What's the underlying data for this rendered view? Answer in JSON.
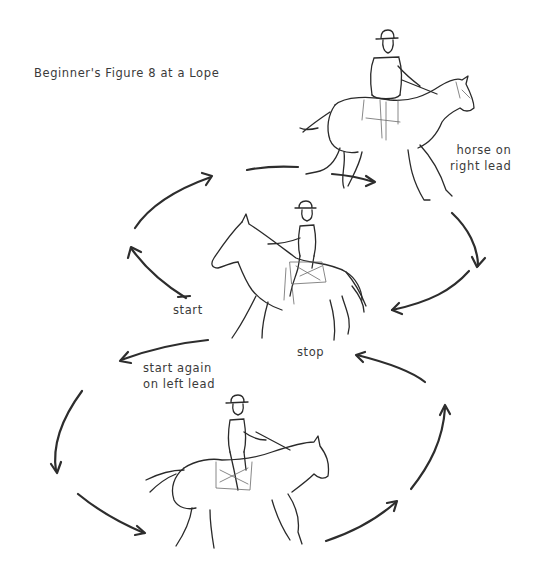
{
  "diagram": {
    "title": "Beginner's Figure 8 at a Lope",
    "labels": {
      "right_lead": [
        "horse on",
        "right lead"
      ],
      "start": "start",
      "stop": "stop",
      "start_again": [
        "start again",
        "on left lead"
      ]
    },
    "figures": [
      {
        "name": "horse-right-lead",
        "description": "horse and rider loping to the right, top"
      },
      {
        "name": "horse-center-stop",
        "description": "horse and rider at center, facing left"
      },
      {
        "name": "horse-left-lead",
        "description": "horse and rider loping to the right, bottom"
      }
    ],
    "arrows": [
      {
        "name": "arrow-start-up-left",
        "direction": "up"
      },
      {
        "name": "arrow-top-left-arc",
        "direction": "right"
      },
      {
        "name": "arrow-top-center",
        "direction": "right"
      },
      {
        "name": "arrow-right-down",
        "direction": "down"
      },
      {
        "name": "arrow-to-center",
        "direction": "left"
      },
      {
        "name": "arrow-start-again",
        "direction": "left"
      },
      {
        "name": "arrow-left-down",
        "direction": "down"
      },
      {
        "name": "arrow-bottom-left",
        "direction": "right"
      },
      {
        "name": "arrow-bottom-right",
        "direction": "up-right"
      },
      {
        "name": "arrow-right-up",
        "direction": "up"
      },
      {
        "name": "arrow-to-stop",
        "direction": "left"
      }
    ],
    "colors": {
      "ink": "#2d2d2d",
      "text": "#3a3a3a",
      "background": "#ffffff"
    }
  }
}
